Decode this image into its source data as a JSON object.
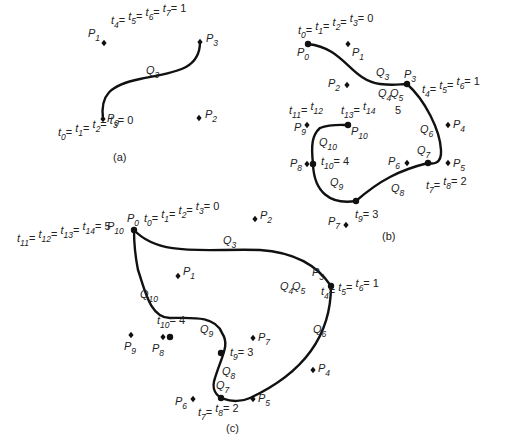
{
  "panels": [
    {
      "id": "a",
      "caption": "(a)",
      "caption_pos": [
        113,
        161
      ],
      "curve_path": "M 103 119 C 100 95, 110 85, 140 79 C 175 72, 200 70, 200 42",
      "control_points": [
        {
          "name": "P",
          "sub": "0",
          "x": 103,
          "y": 119,
          "label_pos": [
            107,
            122
          ]
        },
        {
          "name": "P",
          "sub": "1",
          "x": 104,
          "y": 43,
          "label_pos": [
            88,
            37
          ]
        },
        {
          "name": "P",
          "sub": "2",
          "x": 199,
          "y": 118,
          "label_pos": [
            205,
            118
          ]
        },
        {
          "name": "P",
          "sub": "3",
          "x": 200,
          "y": 42,
          "label_pos": [
            206,
            42
          ]
        }
      ],
      "knots": [],
      "segment_labels": [
        {
          "name": "Q",
          "sub": "3",
          "x": 146,
          "y": 74
        }
      ],
      "knot_labels": [
        {
          "text": "t0= t1= t2= t3= 0",
          "parts": [
            [
              "t",
              "0"
            ],
            [
              "t",
              "1"
            ],
            [
              "t",
              "2"
            ],
            [
              "t",
              "3"
            ]
          ],
          "value": "0",
          "x": 58,
          "y": 136
        },
        {
          "text": "t4= t5= t6= t7= 1",
          "parts": [
            [
              "t",
              "4"
            ],
            [
              "t",
              "5"
            ],
            [
              "t",
              "6"
            ],
            [
              "t",
              "7"
            ]
          ],
          "value": "1",
          "x": 111,
          "y": 24
        }
      ]
    },
    {
      "id": "b",
      "caption": "(b)",
      "caption_pos": [
        382,
        240
      ],
      "curve_path": "M 308 44 C 345 48, 350 80, 380 84 C 395 86, 400 84, 407 84 C 425 100, 440 130, 441 150 C 442 165, 432 164, 428 163 C 400 170, 380 180, 356 201 C 330 205, 314 192, 313 164 C 311 145, 312 135, 320 128 C 330 124, 340 125, 348 125",
      "control_points": [
        {
          "name": "P",
          "sub": "0",
          "x": 308,
          "y": 44,
          "label_pos": [
            297,
            56
          ]
        },
        {
          "name": "P",
          "sub": "1",
          "x": 348,
          "y": 44,
          "label_pos": [
            352,
            56
          ]
        },
        {
          "name": "P",
          "sub": "2",
          "x": 347,
          "y": 85,
          "label_pos": [
            328,
            87
          ]
        },
        {
          "name": "P",
          "sub": "3",
          "x": 407,
          "y": 84,
          "label_pos": [
            404,
            78
          ]
        },
        {
          "name": "P",
          "sub": "4",
          "x": 448,
          "y": 125,
          "label_pos": [
            453,
            128
          ]
        },
        {
          "name": "P",
          "sub": "5",
          "x": 448,
          "y": 163,
          "label_pos": [
            453,
            167
          ]
        },
        {
          "name": "P",
          "sub": "6",
          "x": 407,
          "y": 163,
          "label_pos": [
            388,
            165
          ]
        },
        {
          "name": "P",
          "sub": "7",
          "x": 346,
          "y": 225,
          "label_pos": [
            328,
            225
          ]
        },
        {
          "name": "P",
          "sub": "8",
          "x": 307,
          "y": 164,
          "label_pos": [
            290,
            167
          ]
        },
        {
          "name": "P",
          "sub": "9",
          "x": 307,
          "y": 125,
          "label_pos": [
            294,
            131
          ]
        },
        {
          "name": "P",
          "sub": "10",
          "x": 348,
          "y": 125,
          "label_pos": [
            351,
            135
          ]
        }
      ],
      "knots": [
        {
          "x": 308,
          "y": 44
        },
        {
          "x": 407,
          "y": 84
        },
        {
          "x": 428,
          "y": 163
        },
        {
          "x": 356,
          "y": 201
        },
        {
          "x": 313,
          "y": 164
        },
        {
          "x": 348,
          "y": 125
        }
      ],
      "segment_labels": [
        {
          "name": "Q",
          "sub": "3",
          "x": 376,
          "y": 76
        },
        {
          "name": "Q",
          "sub": "4",
          "x": 378,
          "y": 97
        },
        {
          "name": "Q",
          "sub": "5",
          "x": 390,
          "y": 97
        },
        {
          "name": "Q",
          "sub": "6",
          "x": 420,
          "y": 133
        },
        {
          "name": "Q",
          "sub": "7",
          "x": 417,
          "y": 154
        },
        {
          "name": "Q",
          "sub": "8",
          "x": 391,
          "y": 192
        },
        {
          "name": "Q",
          "sub": "9",
          "x": 330,
          "y": 186
        },
        {
          "name": "Q",
          "sub": "10",
          "x": 319,
          "y": 146
        }
      ],
      "knot_labels": [
        {
          "text": "t0= t1= t2= t3= 0",
          "parts": [
            [
              "t",
              "0"
            ],
            [
              "t",
              "1"
            ],
            [
              "t",
              "2"
            ],
            [
              "t",
              "3"
            ]
          ],
          "value": "0",
          "x": 298,
          "y": 34
        },
        {
          "text": "t4= t5= t6 = 1",
          "parts": [
            [
              "t",
              "4"
            ],
            [
              "t",
              "5"
            ],
            [
              "t",
              "6"
            ]
          ],
          "value": "1",
          "x": 422,
          "y": 93
        },
        {
          "text": "t7= t8= 2",
          "parts": [
            [
              "t",
              "7"
            ],
            [
              "t",
              "8"
            ]
          ],
          "value": "2",
          "x": 426,
          "y": 189
        },
        {
          "text": "t9= 3",
          "parts": [
            [
              "t",
              "9"
            ]
          ],
          "value": "3",
          "x": 355,
          "y": 218
        },
        {
          "text": "t10= 4",
          "parts": [
            [
              "t",
              "10"
            ]
          ],
          "value": "4",
          "x": 321,
          "y": 165
        },
        {
          "text": "t11= t12",
          "parts": [
            [
              "t",
              "11"
            ],
            [
              "t",
              "12"
            ]
          ],
          "value": "",
          "x": 289,
          "y": 114
        },
        {
          "text": "t13= t14",
          "parts": [
            [
              "t",
              "13"
            ],
            [
              "t",
              "14"
            ]
          ],
          "value": "",
          "x": 341,
          "y": 114
        },
        {
          "text": "5",
          "parts": [],
          "value": "5",
          "x": 395,
          "y": 114
        }
      ]
    },
    {
      "id": "c",
      "caption": "(c)",
      "caption_pos": [
        226,
        432
      ],
      "curve_path": "M 134 230 C 160 258, 210 248, 260 250 C 290 252, 315 262, 331 286 C 331 330, 310 370, 250 398 C 235 405, 207 400, 215 378 C 222 355, 230 345, 222 333 C 215 315, 190 318, 170 318 C 150 318, 145 290, 138 270 C 134 250, 134 240, 134 230",
      "control_points": [
        {
          "name": "P",
          "sub": "0",
          "x": 134,
          "y": 230,
          "label_pos": [
            127,
            222
          ]
        },
        {
          "name": "P",
          "sub": "10",
          "x": 134,
          "y": 230,
          "label_pos": [
            107,
            230
          ]
        },
        {
          "name": "P",
          "sub": "1",
          "x": 178,
          "y": 276,
          "label_pos": [
            183,
            275
          ]
        },
        {
          "name": "P",
          "sub": "2",
          "x": 255,
          "y": 219,
          "label_pos": [
            260,
            219
          ]
        },
        {
          "name": "P",
          "sub": "3",
          "x": 331,
          "y": 286,
          "label_pos": [
            312,
            276
          ]
        },
        {
          "name": "P",
          "sub": "4",
          "x": 313,
          "y": 370,
          "label_pos": [
            318,
            372
          ]
        },
        {
          "name": "P",
          "sub": "5",
          "x": 253,
          "y": 399,
          "label_pos": [
            258,
            402
          ]
        },
        {
          "name": "P",
          "sub": "6",
          "x": 193,
          "y": 399,
          "label_pos": [
            175,
            405
          ]
        },
        {
          "name": "P",
          "sub": "7",
          "x": 253,
          "y": 338,
          "label_pos": [
            258,
            341
          ]
        },
        {
          "name": "P",
          "sub": "8",
          "x": 163,
          "y": 337,
          "label_pos": [
            152,
            352
          ]
        },
        {
          "name": "P",
          "sub": "9",
          "x": 131,
          "y": 335,
          "label_pos": [
            124,
            350
          ]
        }
      ],
      "knots": [
        {
          "x": 134,
          "y": 230
        },
        {
          "x": 331,
          "y": 286
        },
        {
          "x": 221,
          "y": 353
        },
        {
          "x": 221,
          "y": 398
        },
        {
          "x": 170,
          "y": 337
        }
      ],
      "segment_labels": [
        {
          "name": "Q",
          "sub": "3",
          "x": 223,
          "y": 244
        },
        {
          "name": "Q",
          "sub": "4",
          "x": 280,
          "y": 290
        },
        {
          "name": "Q",
          "sub": "5",
          "x": 292,
          "y": 290
        },
        {
          "name": "Q",
          "sub": "6",
          "x": 313,
          "y": 333
        },
        {
          "name": "Q",
          "sub": "7",
          "x": 216,
          "y": 389
        },
        {
          "name": "Q",
          "sub": "8",
          "x": 222,
          "y": 375
        },
        {
          "name": "Q",
          "sub": "9",
          "x": 200,
          "y": 333
        },
        {
          "name": "Q",
          "sub": "10",
          "x": 140,
          "y": 298
        }
      ],
      "knot_labels": [
        {
          "text": "t0= t1= t2= t3= 0",
          "parts": [
            [
              "t",
              "0"
            ],
            [
              "t",
              "1"
            ],
            [
              "t",
              "2"
            ],
            [
              "t",
              "3"
            ]
          ],
          "value": "0",
          "x": 144,
          "y": 222
        },
        {
          "text": "t11= t12= t13= t14= 5",
          "parts": [
            [
              "t",
              "11"
            ],
            [
              "t",
              "12"
            ],
            [
              "t",
              "13"
            ],
            [
              "t",
              "14"
            ]
          ],
          "value": "5",
          "x": 17,
          "y": 242
        },
        {
          "text": "t4= t5= t6 = 1",
          "parts": [
            [
              "t",
              "4"
            ],
            [
              "t",
              "5"
            ],
            [
              "t",
              "6"
            ]
          ],
          "value": "1",
          "x": 321,
          "y": 295
        },
        {
          "text": "t10= 4",
          "parts": [
            [
              "t",
              "10"
            ]
          ],
          "value": "4",
          "x": 157,
          "y": 324
        },
        {
          "text": "t9= 3",
          "parts": [
            [
              "t",
              "9"
            ]
          ],
          "value": "3",
          "x": 230,
          "y": 356
        },
        {
          "text": "t7= t8= 2",
          "parts": [
            [
              "t",
              "7"
            ],
            [
              "t",
              "8"
            ]
          ],
          "value": "2",
          "x": 198,
          "y": 416
        }
      ]
    }
  ]
}
